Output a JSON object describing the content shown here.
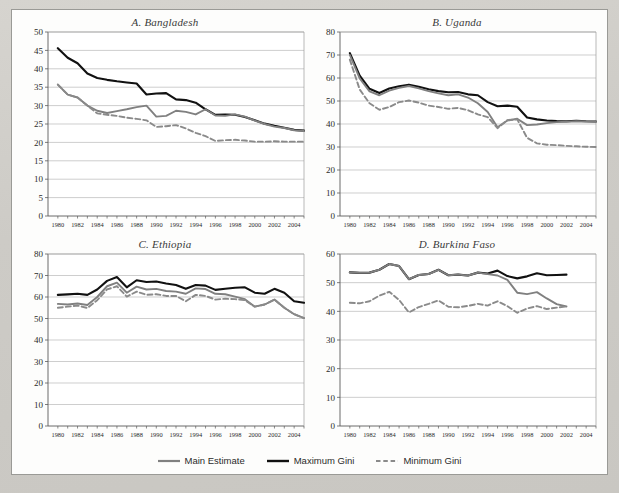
{
  "figure": {
    "background_color": "#cdcbc6",
    "panel_background": "#fdfdfc",
    "border_color": "#9a9a96"
  },
  "legend": {
    "position": "bottom-center",
    "items": [
      {
        "label": "Main Estimate",
        "color": "#808080",
        "style": "solid",
        "width": 2.2,
        "name": "main-estimate"
      },
      {
        "label": "Maximum Gini",
        "color": "#111111",
        "style": "solid",
        "width": 2.4,
        "name": "maximum-gini"
      },
      {
        "label": "Minimum Gini",
        "color": "#8a8a8a",
        "style": "dashed",
        "width": 2.0,
        "name": "minimum-gini"
      }
    ]
  },
  "chart_data": [
    {
      "type": "line",
      "panel": "A",
      "title": "A.  Bangladesh",
      "xlabel": "",
      "ylabel": "",
      "xlim": [
        1979,
        2005
      ],
      "ylim": [
        0,
        50
      ],
      "ytick_step": 5,
      "yticks": [
        0,
        5,
        10,
        15,
        20,
        25,
        30,
        35,
        40,
        45,
        50
      ],
      "xticks": [
        1980,
        1982,
        1984,
        1986,
        1988,
        1990,
        1992,
        1994,
        1996,
        1998,
        2000,
        2002,
        2004
      ],
      "grid": "horizontal",
      "x": [
        1980,
        1981,
        1982,
        1983,
        1984,
        1985,
        1986,
        1987,
        1988,
        1989,
        1990,
        1991,
        1992,
        1993,
        1994,
        1995,
        1996,
        1997,
        1998,
        1999,
        2000,
        2001,
        2002,
        2003,
        2004,
        2005
      ],
      "series": [
        {
          "name": "Maximum Gini",
          "color": "#111111",
          "style": "solid",
          "values": [
            45.6,
            43.0,
            41.5,
            38.7,
            37.5,
            37.0,
            36.6,
            36.3,
            36.0,
            33.0,
            33.3,
            33.4,
            31.7,
            31.5,
            30.8,
            29.0,
            27.5,
            27.6,
            27.5,
            26.9,
            26.0,
            25.1,
            24.5,
            24.0,
            23.4,
            23.2
          ]
        },
        {
          "name": "Main Estimate",
          "color": "#808080",
          "style": "solid",
          "values": [
            35.7,
            33.0,
            32.2,
            30.0,
            28.6,
            28.0,
            28.5,
            29.0,
            29.6,
            30.0,
            27.0,
            27.2,
            28.6,
            28.3,
            27.6,
            29.0,
            27.3,
            27.2,
            27.6,
            27.0,
            25.9,
            25.0,
            24.3,
            23.9,
            23.3,
            23.1
          ]
        },
        {
          "name": "Minimum Gini",
          "color": "#8a8a8a",
          "style": "dashed",
          "values": [
            35.7,
            33.0,
            32.2,
            30.0,
            27.9,
            27.5,
            27.2,
            26.7,
            26.4,
            26.0,
            24.2,
            24.4,
            24.7,
            23.8,
            22.6,
            21.7,
            20.4,
            20.6,
            20.7,
            20.5,
            20.2,
            20.2,
            20.3,
            20.2,
            20.2,
            20.2
          ]
        }
      ]
    },
    {
      "type": "line",
      "panel": "B",
      "title": "B.  Uganda",
      "xlabel": "",
      "ylabel": "",
      "xlim": [
        1979,
        2005
      ],
      "ylim": [
        0,
        80
      ],
      "ytick_step": 10,
      "yticks": [
        0,
        10,
        20,
        30,
        40,
        50,
        60,
        70,
        80
      ],
      "xticks": [
        1980,
        1982,
        1984,
        1986,
        1988,
        1990,
        1992,
        1994,
        1996,
        1998,
        2000,
        2002,
        2004
      ],
      "grid": "horizontal",
      "x": [
        1980,
        1981,
        1982,
        1983,
        1984,
        1985,
        1986,
        1987,
        1988,
        1989,
        1990,
        1991,
        1992,
        1993,
        1994,
        1995,
        1996,
        1997,
        1998,
        1999,
        2000,
        2001,
        2002,
        2003,
        2004,
        2005
      ],
      "series": [
        {
          "name": "Maximum Gini",
          "color": "#111111",
          "style": "solid",
          "values": [
            70.8,
            61.0,
            55.3,
            53.5,
            55.4,
            56.4,
            57.1,
            56.2,
            55.1,
            54.3,
            53.8,
            53.9,
            52.9,
            52.5,
            49.5,
            47.7,
            48.0,
            47.5,
            42.8,
            42.0,
            41.5,
            41.3,
            41.2,
            41.4,
            41.2,
            41.1
          ]
        },
        {
          "name": "Main Estimate",
          "color": "#808080",
          "style": "solid",
          "values": [
            70.0,
            59.8,
            54.2,
            52.5,
            54.5,
            55.7,
            56.5,
            55.5,
            54.3,
            53.3,
            52.5,
            52.9,
            51.5,
            49.0,
            45.2,
            38.6,
            41.5,
            42.3,
            39.5,
            39.8,
            40.4,
            40.8,
            41.0,
            41.2,
            41.1,
            41.0
          ]
        },
        {
          "name": "Minimum Gini",
          "color": "#8a8a8a",
          "style": "dashed",
          "values": [
            68.0,
            55.0,
            49.0,
            46.2,
            47.4,
            49.5,
            50.2,
            49.3,
            48.0,
            47.4,
            46.6,
            47.0,
            46.0,
            44.2,
            43.0,
            38.2,
            41.7,
            42.0,
            34.0,
            31.6,
            31.0,
            30.8,
            30.5,
            30.3,
            30.1,
            30.0
          ]
        }
      ]
    },
    {
      "type": "line",
      "panel": "C",
      "title": "C.  Ethiopia",
      "xlabel": "",
      "ylabel": "",
      "xlim": [
        1979,
        2005
      ],
      "ylim": [
        0,
        80
      ],
      "ytick_step": 10,
      "yticks": [
        0,
        10,
        20,
        30,
        40,
        50,
        60,
        70,
        80
      ],
      "xticks": [
        1980,
        1982,
        1984,
        1986,
        1988,
        1990,
        1992,
        1994,
        1996,
        1998,
        2000,
        2002,
        2004
      ],
      "grid": "horizontal",
      "x": [
        1980,
        1981,
        1982,
        1983,
        1984,
        1985,
        1986,
        1987,
        1988,
        1989,
        1990,
        1991,
        1992,
        1993,
        1994,
        1995,
        1996,
        1997,
        1998,
        1999,
        2000,
        2001,
        2002,
        2003,
        2004,
        2005
      ],
      "series": [
        {
          "name": "Maximum Gini",
          "color": "#111111",
          "style": "solid",
          "values": [
            61.0,
            61.2,
            61.5,
            61.0,
            63.5,
            67.5,
            69.3,
            64.5,
            67.8,
            67.0,
            67.2,
            66.3,
            65.6,
            63.8,
            65.6,
            65.3,
            63.3,
            63.8,
            64.3,
            64.5,
            62.0,
            61.5,
            63.8,
            62.0,
            58.0,
            57.3
          ]
        },
        {
          "name": "Main Estimate",
          "color": "#808080",
          "style": "solid",
          "values": [
            56.8,
            56.5,
            57.0,
            56.3,
            60.0,
            65.0,
            66.7,
            62.0,
            64.8,
            63.5,
            63.8,
            62.8,
            62.5,
            61.5,
            64.0,
            63.7,
            61.5,
            61.3,
            60.2,
            59.0,
            55.5,
            56.5,
            58.8,
            55.0,
            52.0,
            50.2
          ]
        },
        {
          "name": "Minimum Gini",
          "color": "#8a8a8a",
          "style": "dashed",
          "values": [
            55.0,
            55.5,
            56.0,
            54.9,
            58.5,
            63.5,
            65.0,
            60.2,
            62.5,
            61.0,
            61.3,
            60.5,
            60.5,
            58.0,
            61.0,
            60.5,
            58.8,
            59.2,
            59.0,
            58.5,
            55.5,
            56.5,
            58.8,
            55.0,
            52.0,
            50.2
          ]
        }
      ]
    },
    {
      "type": "line",
      "panel": "D",
      "title": "D.  Burkina Faso",
      "xlabel": "",
      "ylabel": "",
      "xlim": [
        1979,
        2005
      ],
      "ylim": [
        0,
        60
      ],
      "ytick_step": 10,
      "yticks": [
        0,
        10,
        20,
        30,
        40,
        50,
        60
      ],
      "xticks": [
        1980,
        1982,
        1984,
        1986,
        1988,
        1990,
        1992,
        1994,
        1996,
        1998,
        2000,
        2002,
        2004
      ],
      "grid": "horizontal",
      "x": [
        1980,
        1981,
        1982,
        1983,
        1984,
        1985,
        1986,
        1987,
        1988,
        1989,
        1990,
        1991,
        1992,
        1993,
        1994,
        1995,
        1996,
        1997,
        1998,
        1999,
        2000,
        2001,
        2002
      ],
      "series": [
        {
          "name": "Maximum Gini",
          "color": "#111111",
          "style": "solid",
          "values": [
            53.6,
            53.4,
            53.5,
            54.5,
            56.5,
            55.8,
            51.2,
            52.7,
            53.0,
            54.5,
            52.6,
            52.8,
            52.5,
            53.5,
            53.2,
            54.2,
            52.3,
            51.5,
            52.2,
            53.3,
            52.6,
            52.7,
            52.8
          ]
        },
        {
          "name": "Main Estimate",
          "color": "#808080",
          "style": "solid",
          "values": [
            53.6,
            53.4,
            53.5,
            54.5,
            56.5,
            55.8,
            51.2,
            52.7,
            53.0,
            54.5,
            52.6,
            52.8,
            52.5,
            53.5,
            53.0,
            52.5,
            51.0,
            46.5,
            46.0,
            46.7,
            44.5,
            42.5,
            41.7
          ]
        },
        {
          "name": "Minimum Gini",
          "color": "#8a8a8a",
          "style": "dashed",
          "values": [
            43.0,
            42.8,
            43.5,
            45.5,
            46.8,
            44.0,
            39.6,
            41.5,
            42.6,
            43.8,
            41.6,
            41.4,
            41.9,
            42.6,
            42.0,
            43.5,
            41.8,
            39.5,
            41.0,
            41.8,
            40.8,
            41.3,
            41.7
          ]
        }
      ]
    }
  ]
}
